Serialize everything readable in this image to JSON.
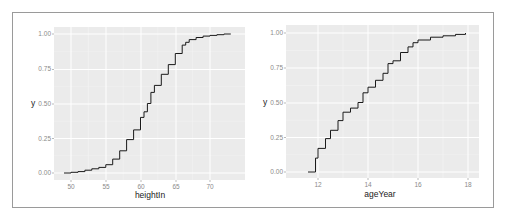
{
  "chart_data": [
    {
      "type": "line",
      "subtype": "ecdf-step",
      "title": "",
      "xlabel": "heightIn",
      "ylabel": "y",
      "xlim": [
        48.5,
        74
      ],
      "ylim": [
        -0.03,
        1.03
      ],
      "xticks": [
        50,
        55,
        60,
        65,
        70
      ],
      "xtick_labels": [
        "50",
        "55",
        "60",
        "65",
        "70"
      ],
      "yticks": [
        0,
        0.25,
        0.5,
        0.75,
        1.0
      ],
      "ytick_labels": [
        "0.00",
        "0.25",
        "0.50",
        "0.75",
        "1.00"
      ],
      "grid": true,
      "background": "#ebebeb",
      "line_color": "#000000",
      "x": [
        49.0,
        50.0,
        51.0,
        52.0,
        53.0,
        54.0,
        55.0,
        56.0,
        57.0,
        58.0,
        59.0,
        60.0,
        60.5,
        61.0,
        61.5,
        62.0,
        63.0,
        64.0,
        65.0,
        66.0,
        66.5,
        67.0,
        68.0,
        69.0,
        70.0,
        71.0,
        72.0,
        73.0
      ],
      "y": [
        0.0,
        0.005,
        0.01,
        0.02,
        0.03,
        0.04,
        0.06,
        0.1,
        0.16,
        0.24,
        0.31,
        0.4,
        0.44,
        0.5,
        0.58,
        0.63,
        0.71,
        0.78,
        0.86,
        0.92,
        0.94,
        0.96,
        0.975,
        0.985,
        0.99,
        0.995,
        1.0,
        1.0
      ]
    },
    {
      "type": "line",
      "subtype": "ecdf-step",
      "title": "",
      "xlabel": "ageYear",
      "ylabel": "y",
      "xlim": [
        11.1,
        18.3
      ],
      "ylim": [
        -0.03,
        1.03
      ],
      "xticks": [
        12,
        14,
        16,
        18
      ],
      "xtick_labels": [
        "12",
        "14",
        "16",
        "18"
      ],
      "yticks": [
        0,
        0.25,
        0.5,
        0.75,
        1.0
      ],
      "ytick_labels": [
        "0.00",
        "0.25",
        "0.50",
        "0.75",
        "1.00"
      ],
      "grid": true,
      "background": "#ebebeb",
      "line_color": "#000000",
      "x": [
        11.6,
        11.9,
        12.0,
        12.3,
        12.5,
        12.8,
        13.0,
        13.3,
        13.6,
        13.8,
        14.0,
        14.3,
        14.6,
        14.8,
        15.0,
        15.3,
        15.6,
        15.8,
        16.0,
        16.5,
        17.0,
        17.5,
        17.9
      ],
      "y": [
        0.0,
        0.1,
        0.17,
        0.24,
        0.3,
        0.37,
        0.43,
        0.46,
        0.5,
        0.57,
        0.61,
        0.66,
        0.71,
        0.78,
        0.8,
        0.86,
        0.9,
        0.93,
        0.95,
        0.97,
        0.98,
        0.99,
        1.0
      ]
    }
  ],
  "panels": [
    {
      "xlabel": "heightIn",
      "ylabel": "y",
      "yticks": [
        "0.00",
        "0.25",
        "0.50",
        "0.75",
        "1.00"
      ],
      "xticks": [
        "50",
        "55",
        "60",
        "65",
        "70"
      ]
    },
    {
      "xlabel": "ageYear",
      "ylabel": "y",
      "yticks": [
        "0.00",
        "0.25",
        "0.50",
        "0.75",
        "1.00"
      ],
      "xticks": [
        "12",
        "14",
        "16",
        "18"
      ]
    }
  ],
  "colors": {
    "panel_bg": "#ebebeb",
    "grid": "#ffffff",
    "line": "#1a1a1a",
    "frame": "#9a9a9a",
    "tick_text": "#8a8a8a"
  }
}
